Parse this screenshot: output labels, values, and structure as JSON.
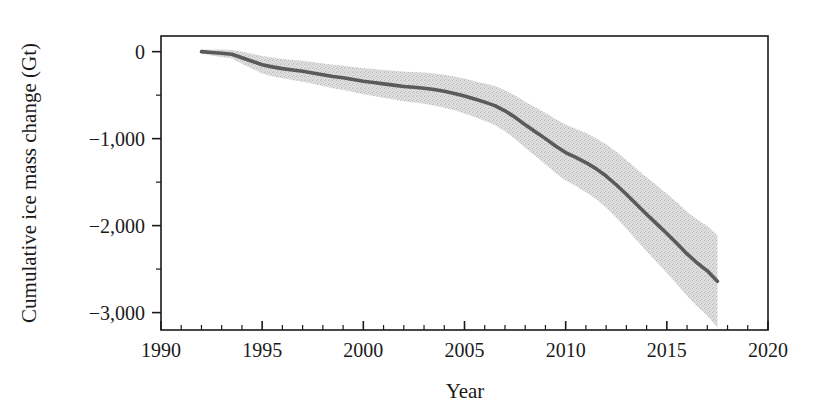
{
  "chart_data": {
    "type": "line",
    "title": "",
    "xlabel": "Year",
    "ylabel": "Cumulative ice mass change (Gt)",
    "xlim": [
      1990,
      2020
    ],
    "ylim": [
      -3200,
      180
    ],
    "grid": false,
    "legend": "none",
    "xticks": [
      1990,
      1995,
      2000,
      2005,
      2010,
      2015,
      2020
    ],
    "xtick_labels": [
      "1990",
      "1995",
      "2000",
      "2005",
      "2010",
      "2015",
      "2020"
    ],
    "x_minor_tick_step": 1,
    "yticks": [
      0,
      -1000,
      -2000,
      -3000
    ],
    "ytick_labels": [
      "0",
      "−1,000",
      "−2,000",
      "−3,000"
    ],
    "y_minor_ticks": [
      -500,
      -1500,
      -2500
    ],
    "x": [
      1992.0,
      1992.5,
      1993.0,
      1993.5,
      1994.0,
      1994.5,
      1995.0,
      1995.5,
      1996.0,
      1996.5,
      1997.0,
      1997.5,
      1998.0,
      1998.5,
      1999.0,
      1999.5,
      2000.0,
      2000.5,
      2001.0,
      2001.5,
      2002.0,
      2002.5,
      2003.0,
      2003.5,
      2004.0,
      2004.5,
      2005.0,
      2005.5,
      2006.0,
      2006.5,
      2007.0,
      2007.5,
      2008.0,
      2008.5,
      2009.0,
      2009.5,
      2010.0,
      2010.5,
      2011.0,
      2011.5,
      2012.0,
      2012.5,
      2013.0,
      2013.5,
      2014.0,
      2014.5,
      2015.0,
      2015.5,
      2016.0,
      2016.5,
      2017.0,
      2017.5
    ],
    "series": [
      {
        "name": "Cumulative ice mass change",
        "role": "mean",
        "color": "#5a5a5a",
        "values": [
          0,
          -10,
          -18,
          -30,
          -70,
          -110,
          -150,
          -175,
          -195,
          -210,
          -225,
          -245,
          -265,
          -285,
          -300,
          -320,
          -340,
          -355,
          -370,
          -385,
          -400,
          -410,
          -420,
          -435,
          -455,
          -480,
          -510,
          -545,
          -580,
          -620,
          -680,
          -755,
          -840,
          -920,
          -1000,
          -1085,
          -1160,
          -1215,
          -1275,
          -1345,
          -1430,
          -1530,
          -1640,
          -1755,
          -1870,
          -1980,
          -2090,
          -2205,
          -2325,
          -2430,
          -2520,
          -2640
        ]
      },
      {
        "name": "Uncertainty band (upper)",
        "role": "band_upper",
        "color": "#d5d5d5",
        "values": [
          25,
          25,
          25,
          20,
          0,
          -25,
          -50,
          -68,
          -85,
          -95,
          -105,
          -120,
          -135,
          -150,
          -160,
          -175,
          -190,
          -200,
          -210,
          -220,
          -230,
          -235,
          -240,
          -250,
          -265,
          -285,
          -310,
          -340,
          -365,
          -395,
          -445,
          -505,
          -575,
          -640,
          -705,
          -775,
          -840,
          -885,
          -935,
          -995,
          -1065,
          -1150,
          -1245,
          -1345,
          -1445,
          -1540,
          -1635,
          -1735,
          -1840,
          -1930,
          -2005,
          -2110
        ]
      },
      {
        "name": "Uncertainty band (lower)",
        "role": "band_lower",
        "color": "#d5d5d5",
        "values": [
          -25,
          -45,
          -61,
          -80,
          -140,
          -195,
          -250,
          -282,
          -305,
          -325,
          -345,
          -370,
          -395,
          -420,
          -440,
          -465,
          -490,
          -510,
          -530,
          -550,
          -570,
          -585,
          -600,
          -620,
          -645,
          -675,
          -710,
          -750,
          -795,
          -845,
          -915,
          -1005,
          -1105,
          -1200,
          -1295,
          -1395,
          -1480,
          -1545,
          -1615,
          -1695,
          -1795,
          -1910,
          -2035,
          -2165,
          -2295,
          -2420,
          -2545,
          -2675,
          -2810,
          -2930,
          -3035,
          -3170
        ]
      }
    ]
  },
  "colors": {
    "axis": "#1a1a1a",
    "mean_line": "#5a5a5a",
    "band_fill": "#d5d5d5",
    "background": "#ffffff"
  }
}
